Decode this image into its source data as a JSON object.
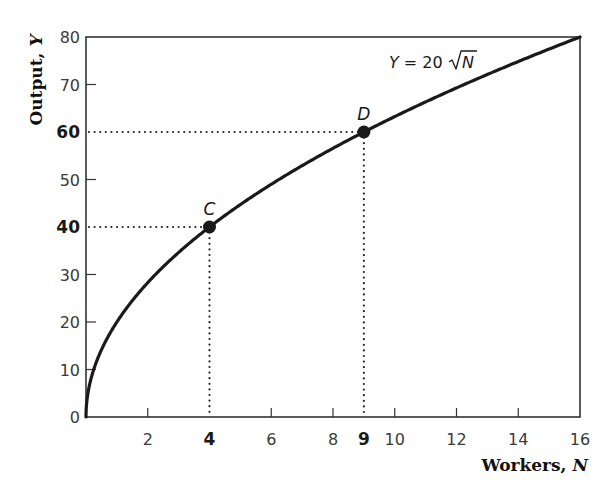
{
  "chart_data": {
    "type": "line",
    "title": "",
    "xlabel": "Workers, N",
    "xlabel_text": "Workers, ",
    "xlabel_var": "N",
    "ylabel": "Output, Y",
    "ylabel_text": "Output, ",
    "ylabel_var": "Y",
    "xlim": [
      0,
      16
    ],
    "ylim": [
      0,
      80
    ],
    "grid": false,
    "legend": null,
    "x_ticks": [
      {
        "value": 2,
        "label": "2",
        "bold": false
      },
      {
        "value": 4,
        "label": "4",
        "bold": true
      },
      {
        "value": 6,
        "label": "6",
        "bold": false
      },
      {
        "value": 8,
        "label": "8",
        "bold": false
      },
      {
        "value": 9,
        "label": "9",
        "bold": true
      },
      {
        "value": 10,
        "label": "10",
        "bold": false
      },
      {
        "value": 12,
        "label": "12",
        "bold": false
      },
      {
        "value": 14,
        "label": "14",
        "bold": false
      },
      {
        "value": 16,
        "label": "16",
        "bold": false
      }
    ],
    "y_ticks": [
      {
        "value": 0,
        "label": "0",
        "bold": false
      },
      {
        "value": 10,
        "label": "10",
        "bold": false
      },
      {
        "value": 20,
        "label": "20",
        "bold": false
      },
      {
        "value": 30,
        "label": "30",
        "bold": false
      },
      {
        "value": 40,
        "label": "40",
        "bold": true
      },
      {
        "value": 50,
        "label": "50",
        "bold": false
      },
      {
        "value": 60,
        "label": "60",
        "bold": true
      },
      {
        "value": 70,
        "label": "70",
        "bold": false
      },
      {
        "value": 80,
        "label": "80",
        "bold": false
      }
    ],
    "series": [
      {
        "name": "Y = 20√N",
        "function": "Y = 20 * sqrt(N)",
        "x": [
          0,
          0.25,
          1,
          2,
          4,
          6,
          8,
          9,
          10,
          12,
          14,
          16
        ],
        "values": [
          0,
          10,
          20,
          28.28,
          40,
          48.99,
          56.57,
          60,
          63.25,
          69.28,
          74.83,
          80
        ]
      }
    ],
    "annotations": [
      {
        "type": "curve-label",
        "text_prefix": "Y = 20 ",
        "text_var": "N",
        "text": "Y = 20 √N",
        "x": 11.4,
        "y": 72.5
      },
      {
        "type": "point",
        "label": "C",
        "x": 4,
        "y": 40,
        "guides": true
      },
      {
        "type": "point",
        "label": "D",
        "x": 9,
        "y": 60,
        "guides": true
      }
    ]
  },
  "colors": {
    "curve": "#1a1a1a",
    "axis": "#333333",
    "guide": "#222222",
    "point": "#1a1a1a",
    "background": "#ffffff"
  }
}
